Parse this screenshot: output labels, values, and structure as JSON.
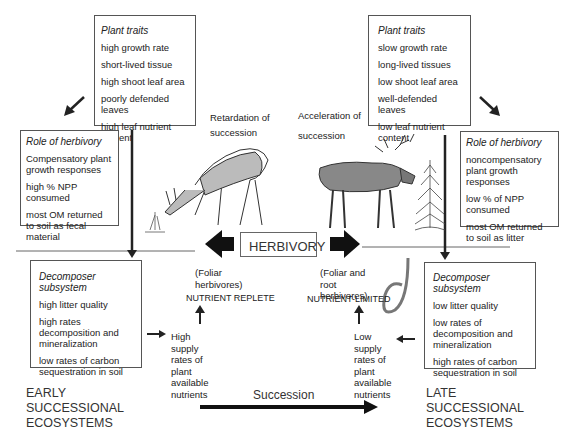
{
  "left_plant_traits": {
    "title": "Plant traits",
    "items": [
      "high growth rate",
      "short-lived tissue",
      "high shoot leaf area",
      "poorly defended leaves",
      "high leaf nutrient content"
    ]
  },
  "right_plant_traits": {
    "title": "Plant traits",
    "items": [
      "slow growth rate",
      "long-lived tissues",
      "low shoot leaf area",
      "well-defended leaves",
      "low leaf nutrient content"
    ]
  },
  "left_role": {
    "title": "Role of herbivory",
    "items": [
      "Compensatory plant growth responses",
      "high % NPP consumed",
      "most OM returned to soil as fecal material"
    ]
  },
  "right_role": {
    "title": "Role of herbivory",
    "items": [
      "noncompensatory plant growth responses",
      "low % of NPP consumed",
      "most OM returned to soil as litter"
    ]
  },
  "left_decomposer": {
    "title": "Decomposer subsystem",
    "items": [
      "high litter quality",
      "high rates decomposition and mineralization",
      "low rates of carbon sequestration in soil"
    ]
  },
  "right_decomposer": {
    "title": "Decomposer subsystem",
    "items": [
      "low litter quality",
      "low rates of decomposition and mineralization",
      "high rates of carbon sequestration in soil"
    ]
  },
  "center": {
    "herbivory": "HERBIVORY",
    "retardation": "Retardation of succession",
    "acceleration_1": "Acceleration of",
    "acceleration_2": "succession",
    "left_herbivores": "(Foliar herbivores)",
    "right_herbivores": "(Foliar and root herbivores)",
    "nutrient_replete": "NUTRIENT REPLETE",
    "nutrient_limited": "NUTRIENT-LIMITED",
    "high_supply": "High supply rates of plant available nutrients",
    "low_supply": "Low supply rates of plant available nutrients",
    "succession": "Succession"
  },
  "labels": {
    "early": "EARLY SUCCESSIONAL ECOSYSTEMS",
    "late": "LATE SUCCESSIONAL ECOSYSTEMS"
  },
  "illustrations": [
    "deer-grazing",
    "moose",
    "spruce-tree",
    "earthworm"
  ]
}
